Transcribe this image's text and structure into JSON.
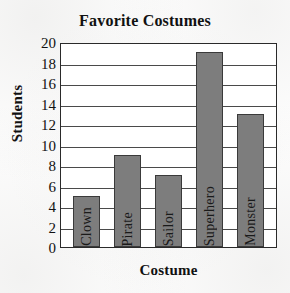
{
  "chart_data": {
    "type": "bar",
    "title": "Favorite Costumes",
    "xlabel": "Costume",
    "ylabel": "Students",
    "categories": [
      "Clown",
      "Pirate",
      "Sailor",
      "Superhero",
      "Monster"
    ],
    "values": [
      5,
      9,
      7,
      19,
      13
    ],
    "ylim": [
      0,
      20
    ],
    "ytick_step": 2,
    "yticks": [
      0,
      2,
      4,
      6,
      8,
      10,
      12,
      14,
      16,
      18,
      20
    ],
    "ytick_labels": [
      "0",
      "2",
      "4",
      "6",
      "8",
      "10",
      "12",
      "14",
      "16",
      "18",
      "20"
    ],
    "grid": true,
    "grid_axis": "y",
    "legend": false,
    "bar_color": "#7d7d7d",
    "bar_edge_color": "#3a3a3a",
    "axis_color": "#2a2a2a",
    "background_color": "#ffffff",
    "category_label_rotation": 90,
    "category_labels_inside_bars": true
  }
}
